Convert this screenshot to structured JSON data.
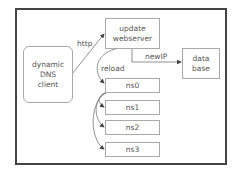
{
  "diagram": {
    "nodes": {
      "client": {
        "label": "dynamic\nDNS\nclient",
        "lines": [
          "dynamic",
          "DNS",
          "client"
        ]
      },
      "webserver": {
        "lines": [
          "update",
          "webserver"
        ]
      },
      "database": {
        "lines": [
          "data",
          "base"
        ]
      },
      "ns": [
        "ns0",
        "ns1",
        "ns2",
        "ns3"
      ]
    },
    "edges": {
      "http": "http",
      "newip": "newIP",
      "reload": "reload"
    },
    "colors": {
      "frame": "#444444",
      "box_border": "#aaaaaa",
      "line": "#777777",
      "text": "#555555"
    }
  }
}
